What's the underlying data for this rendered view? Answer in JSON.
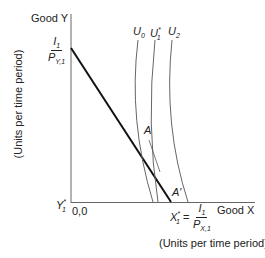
{
  "diagram": {
    "y_axis_label": "Good Y",
    "y_axis_units": "(Units per time period)",
    "x_axis_label": "Good X",
    "x_axis_units": "(Units per time period)",
    "origin_label": "0,0",
    "y_intercept": {
      "numerator": "I",
      "numerator_sub": "1",
      "denominator": "P",
      "denominator_sub": "Y,1"
    },
    "x_intercept": {
      "prefix": "X",
      "prefix_sub": "1",
      "prefix_sup": "*",
      "eq": "=",
      "numerator": "I",
      "numerator_sub": "1",
      "denominator": "P",
      "denominator_sub": "X,1"
    },
    "y_star": {
      "label": "Y",
      "sub": "1",
      "sup": "*"
    },
    "curves": [
      {
        "label": "U",
        "sub": "0",
        "sup": ""
      },
      {
        "label": "U",
        "sub": "1",
        "sup": "*"
      },
      {
        "label": "U",
        "sub": "2",
        "sup": ""
      }
    ],
    "points": {
      "A": "A",
      "A_prime": "A′"
    },
    "colors": {
      "axis": "#555555",
      "budget_line": "#111111",
      "curve": "#666666"
    }
  }
}
